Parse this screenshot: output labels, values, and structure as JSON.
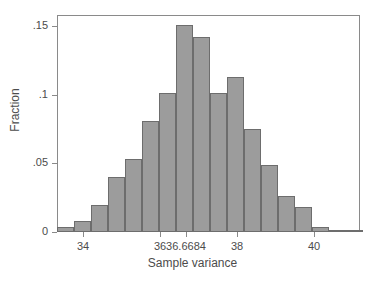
{
  "chart_data": {
    "type": "bar",
    "title": "",
    "subtitle": "",
    "xlabel": "Sample variance",
    "ylabel": "Fraction",
    "grid": false,
    "legend": null,
    "xlim": [
      33.32,
      41.21
    ],
    "ylim": [
      0,
      0.158
    ],
    "xticks": [
      34,
      36,
      36.6684,
      38,
      40
    ],
    "xtick_labels": [
      "34",
      "36",
      "36.6684",
      "38",
      "40"
    ],
    "yticks": [
      0,
      0.05,
      0.1,
      0.15
    ],
    "ytick_labels": [
      "0",
      ".05",
      ".1",
      ".15"
    ],
    "bin_width": 0.4425,
    "bar_fill": "#9c9c9c",
    "bar_edge": "#6d6d6d",
    "frame_color": "#8a8a8a",
    "text_color": "#4c4c4c",
    "x": [
      33.48,
      33.93,
      34.37,
      34.81,
      35.26,
      35.7,
      36.14,
      36.59,
      37.03,
      37.47,
      37.92,
      38.36,
      38.8,
      39.25,
      39.69,
      40.13,
      40.58,
      41.02
    ],
    "bin_starts": [
      33.32,
      33.76,
      34.2,
      34.65,
      35.09,
      35.53,
      35.98,
      36.42,
      36.86,
      37.31,
      37.75,
      38.19,
      38.64,
      39.08,
      39.52,
      39.97,
      40.41,
      40.85
    ],
    "values": [
      0.004,
      0.008,
      0.02,
      0.04,
      0.053,
      0.081,
      0.101,
      0.151,
      0.142,
      0.101,
      0.113,
      0.075,
      0.049,
      0.026,
      0.018,
      0.004,
      0.0015,
      0.0008
    ],
    "categories": [
      "33.48",
      "33.93",
      "34.37",
      "34.81",
      "35.26",
      "35.70",
      "36.14",
      "36.59",
      "37.03",
      "37.47",
      "37.92",
      "38.36",
      "38.80",
      "39.25",
      "39.69",
      "40.13",
      "40.58",
      "41.02"
    ]
  }
}
